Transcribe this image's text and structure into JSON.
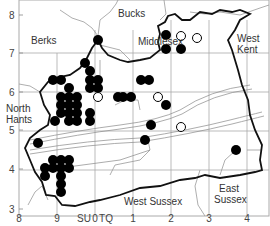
{
  "map": {
    "frame_color": "#999999",
    "grid_color": "#aaaaaa",
    "boundary_color": "#111111",
    "minor_line_color": "#999999",
    "dot_color": "#000000",
    "open_dot_color": "#ffffff",
    "region_labels": [
      {
        "text": "Bucks",
        "x": 118,
        "y": 17
      },
      {
        "text": "Berks",
        "x": 31,
        "y": 44
      },
      {
        "text": "Middlesex",
        "x": 138,
        "y": 45
      },
      {
        "text": "West",
        "x": 237,
        "y": 42
      },
      {
        "text": "Kent",
        "x": 237,
        "y": 53
      },
      {
        "text": "North",
        "x": 6,
        "y": 112
      },
      {
        "text": "Hants",
        "x": 6,
        "y": 123
      },
      {
        "text": "West Sussex",
        "x": 124,
        "y": 205
      },
      {
        "text": "East",
        "x": 219,
        "y": 192
      },
      {
        "text": "Sussex",
        "x": 214,
        "y": 203
      }
    ],
    "y_ticks": [
      {
        "label": "8",
        "y": 18
      },
      {
        "label": "7",
        "y": 56
      },
      {
        "label": "6",
        "y": 95
      },
      {
        "label": "5",
        "y": 133
      },
      {
        "label": "4",
        "y": 172
      },
      {
        "label": "3",
        "y": 212
      }
    ],
    "x_ticks": [
      {
        "label": "8",
        "x": 19
      },
      {
        "label": "9",
        "x": 57
      },
      {
        "label": "SU",
        "x": 84
      },
      {
        "label": "0",
        "x": 95
      },
      {
        "label": "TQ",
        "x": 106
      },
      {
        "label": "1",
        "x": 133
      },
      {
        "label": "2",
        "x": 171
      },
      {
        "label": "3",
        "x": 209
      },
      {
        "label": "4",
        "x": 247
      }
    ],
    "filled_dots": [
      [
        98,
        40
      ],
      [
        85,
        63
      ],
      [
        53,
        80
      ],
      [
        61,
        80
      ],
      [
        90,
        71
      ],
      [
        90,
        80
      ],
      [
        90,
        88
      ],
      [
        98,
        88
      ],
      [
        98,
        80
      ],
      [
        69,
        88
      ],
      [
        61,
        97
      ],
      [
        69,
        97
      ],
      [
        77,
        97
      ],
      [
        69,
        105
      ],
      [
        77,
        105
      ],
      [
        61,
        105
      ],
      [
        69,
        113
      ],
      [
        77,
        113
      ],
      [
        61,
        113
      ],
      [
        69,
        121
      ],
      [
        77,
        121
      ],
      [
        90,
        113
      ],
      [
        90,
        121
      ],
      [
        55,
        121
      ],
      [
        123,
        97
      ],
      [
        131,
        97
      ],
      [
        141,
        80
      ],
      [
        149,
        80
      ],
      [
        118,
        97
      ],
      [
        166,
        35
      ],
      [
        166,
        49
      ],
      [
        181,
        49
      ],
      [
        166,
        105
      ],
      [
        151,
        125
      ],
      [
        38,
        143
      ],
      [
        53,
        160
      ],
      [
        61,
        160
      ],
      [
        69,
        160
      ],
      [
        53,
        168
      ],
      [
        61,
        168
      ],
      [
        69,
        168
      ],
      [
        45,
        168
      ],
      [
        45,
        176
      ],
      [
        61,
        176
      ],
      [
        61,
        184
      ],
      [
        61,
        192
      ],
      [
        236,
        150
      ],
      [
        145,
        140
      ]
    ],
    "open_dots": [
      [
        98,
        97
      ],
      [
        181,
        36
      ],
      [
        197,
        38
      ],
      [
        158,
        97
      ],
      [
        181,
        127
      ]
    ]
  }
}
